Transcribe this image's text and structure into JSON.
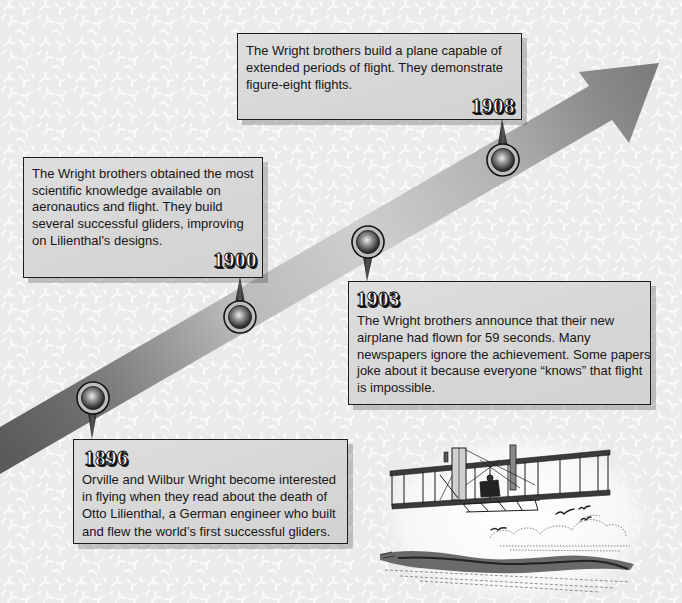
{
  "timeline": {
    "events": [
      {
        "year": "1896",
        "lines": [
          "Orville and Wilbur Wright become interested",
          "in flying when they read about the death of",
          "Otto Lilienthal, a German engineer who built",
          "and flew the world’s first successful gliders."
        ]
      },
      {
        "year": "1900",
        "lines": [
          "The Wright brothers obtained the most",
          "scientific knowledge available on",
          "aeronautics and flight. They build",
          "several successful gliders, improving",
          "on Lilienthal's designs."
        ]
      },
      {
        "year": "1903",
        "lines": [
          "The Wright brothers announce that their new",
          "airplane had flown for 59 seconds. Many",
          "newspapers ignore the achievement. Some papers",
          "joke about it because everyone “knows” that flight",
          "is impossible."
        ]
      },
      {
        "year": "1908",
        "lines": [
          "The Wright brothers build a plane capable of",
          "extended periods of flight. They demonstrate",
          "figure-eight flights."
        ]
      }
    ]
  },
  "arrow": {
    "icon": "timeline-arrow-icon",
    "colors": [
      "#5a5a5a",
      "#cecece",
      "#7a7a7a"
    ]
  },
  "illustration": {
    "icon": "wright-flyer-biplane-icon"
  },
  "colors": {
    "background": "#ececec",
    "card_fill": "#d8d8d8",
    "card_border": "#1c1c1c",
    "text": "#161616"
  }
}
